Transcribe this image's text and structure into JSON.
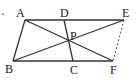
{
  "figure": {
    "type": "geometry",
    "points": {
      "A": {
        "label": "A",
        "x": 25,
        "y": 20
      },
      "D": {
        "label": "D",
        "x": 64,
        "y": 20
      },
      "E": {
        "label": "E",
        "x": 124,
        "y": 20
      },
      "B": {
        "label": "B",
        "x": 13,
        "y": 61
      },
      "C": {
        "label": "C",
        "x": 73,
        "y": 61
      },
      "F": {
        "label": "F",
        "x": 113,
        "y": 61
      },
      "P": {
        "label": "P",
        "x": 69,
        "y": 42
      }
    },
    "segments_solid": [
      "AE",
      "BF",
      "AB",
      "DC",
      "AF",
      "BE"
    ],
    "segments_dashed": [
      "EF"
    ],
    "marker": "·"
  }
}
